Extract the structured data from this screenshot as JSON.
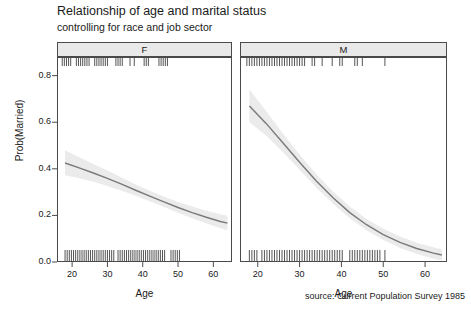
{
  "title": "Relationship of age and marital status",
  "subtitle": "controlling for race and job sector",
  "source": "source: Current Population Survey 1985",
  "axes": {
    "xlabel": "Age",
    "ylabel": "Prob(Married)",
    "ytick_labels": [
      "0.0",
      "0.2",
      "0.4",
      "0.6",
      "0.8"
    ],
    "xtick_labels": [
      "20",
      "30",
      "40",
      "50",
      "60"
    ]
  },
  "strips": {
    "left_label": "F",
    "right_label": "M"
  },
  "colors": {
    "line": "#7a7a7a",
    "band": "#ebebeb",
    "strip_bg": "#e9e9e9",
    "frame": "#4a4a4a",
    "rug": "#555555",
    "text": "#1a1a1a"
  },
  "chart_data": {
    "type": "line",
    "title": "Relationship of age and marital status",
    "subtitle": "controlling for race and job sector",
    "xlabel": "Age",
    "ylabel": "Prob(Married)",
    "xlim": [
      16,
      65
    ],
    "ylim": [
      0.0,
      0.88
    ],
    "xticks": [
      20,
      30,
      40,
      50,
      60
    ],
    "yticks": [
      0.0,
      0.2,
      0.4,
      0.6,
      0.8
    ],
    "grid": false,
    "legend": null,
    "conditioning_variable": "sex",
    "panels": [
      {
        "name": "F",
        "series": [
          {
            "name": "Prob(Married) fit",
            "x": [
              18,
              22,
              26,
              30,
              34,
              38,
              42,
              46,
              50,
              54,
              58,
              62,
              64
            ],
            "y": [
              0.425,
              0.404,
              0.382,
              0.359,
              0.334,
              0.308,
              0.283,
              0.258,
              0.234,
              0.212,
              0.192,
              0.174,
              0.167
            ],
            "band_lower": [
              0.372,
              0.36,
              0.344,
              0.326,
              0.306,
              0.284,
              0.261,
              0.236,
              0.211,
              0.188,
              0.166,
              0.145,
              0.136
            ],
            "band_upper": [
              0.48,
              0.45,
              0.421,
              0.393,
              0.363,
              0.333,
              0.306,
              0.281,
              0.258,
              0.238,
              0.22,
              0.205,
              0.199
            ]
          }
        ],
        "rug_top_x": [
          17.2,
          17.8,
          18.4,
          19.0,
          19.6,
          21.2,
          21.8,
          22.4,
          23.0,
          23.6,
          24.2,
          24.8,
          26.4,
          27.0,
          27.6,
          28.2,
          28.8,
          29.4,
          30.0,
          32.4,
          33.0,
          33.6,
          34.2,
          36.4,
          37.6,
          40.4,
          41.0,
          41.6,
          44.6,
          45.2,
          45.8,
          46.4,
          47.0
        ],
        "rug_bottom_x": [
          18.0,
          18.6,
          19.2,
          19.8,
          20.4,
          21.0,
          21.6,
          22.2,
          22.8,
          23.4,
          24.0,
          24.6,
          25.2,
          25.8,
          26.4,
          27.0,
          27.6,
          28.2,
          28.8,
          29.4,
          30.0,
          30.6,
          31.2,
          31.8,
          33.0,
          33.6,
          34.2,
          34.8,
          35.4,
          36.0,
          36.6,
          37.2,
          37.8,
          38.4,
          39.0,
          39.6,
          40.2,
          40.8,
          41.4,
          42.0,
          42.6,
          43.2,
          43.8,
          44.4,
          45.0,
          45.6,
          46.2,
          48.0,
          48.6,
          49.2,
          49.8,
          50.4
        ]
      },
      {
        "name": "M",
        "series": [
          {
            "name": "Prob(Married) fit",
            "x": [
              18,
              22,
              26,
              30,
              34,
              38,
              42,
              46,
              50,
              54,
              58,
              62,
              64
            ],
            "y": [
              0.67,
              0.595,
              0.512,
              0.428,
              0.348,
              0.276,
              0.212,
              0.16,
              0.118,
              0.084,
              0.058,
              0.038,
              0.03
            ],
            "band_lower": [
              0.6,
              0.543,
              0.472,
              0.396,
              0.32,
              0.25,
              0.188,
              0.136,
              0.094,
              0.06,
              0.034,
              0.014,
              0.006
            ],
            "band_upper": [
              0.74,
              0.648,
              0.552,
              0.461,
              0.377,
              0.303,
              0.238,
              0.185,
              0.143,
              0.109,
              0.083,
              0.063,
              0.055
            ]
          }
        ],
        "rug_top_x": [
          17.4,
          18.0,
          18.6,
          19.2,
          19.8,
          20.4,
          21.0,
          21.6,
          22.2,
          22.8,
          23.4,
          24.0,
          24.6,
          25.2,
          25.8,
          26.4,
          27.0,
          27.6,
          28.2,
          28.8,
          29.4,
          30.0,
          30.6,
          31.2,
          33.0,
          33.6,
          35.4,
          37.8,
          39.6,
          40.2,
          43.2,
          43.8,
          45.0,
          50.4
        ],
        "rug_bottom_x": [
          18.0,
          18.6,
          19.2,
          19.8,
          21.0,
          21.6,
          22.2,
          22.8,
          23.4,
          24.0,
          24.6,
          25.2,
          25.8,
          26.4,
          27.0,
          27.6,
          28.2,
          28.8,
          29.4,
          30.0,
          30.6,
          31.2,
          31.8,
          32.4,
          33.0,
          33.6,
          34.2,
          34.8,
          35.4,
          36.0,
          36.6,
          37.2,
          37.8,
          38.4,
          39.0,
          39.6,
          40.2,
          42.0,
          42.6,
          43.2,
          43.8,
          44.4,
          45.0,
          45.6,
          46.2,
          46.8,
          47.4,
          48.0,
          48.6,
          49.2,
          50.4
        ]
      }
    ]
  }
}
